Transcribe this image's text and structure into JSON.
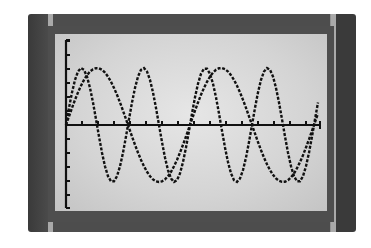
{
  "chart_data": {
    "type": "line",
    "title": "",
    "xlabel": "",
    "ylabel": "",
    "grid": false,
    "legend": null,
    "device": "graphing calculator screen",
    "axes": {
      "origin_px": [
        66,
        125
      ],
      "y_axis_top_px": 40,
      "y_axis_bottom_px": 208,
      "x_axis_right_px": 320,
      "x_tick_spacing_px": 16,
      "y_tick_spacing_px": 14
    },
    "series": [
      {
        "name": "wave-fast",
        "function": "sin",
        "amplitude_px": 57,
        "period_px": 62,
        "phase_px": 0,
        "approx_cycles_shown": 4
      },
      {
        "name": "wave-slow",
        "function": "sin",
        "amplitude_px": 57,
        "period_px": 124,
        "phase_px": 0,
        "approx_cycles_shown": 2
      }
    ],
    "colors": {
      "line": "#111111",
      "screen": "#d8d8d8",
      "frame": "#3f3f3f"
    }
  }
}
